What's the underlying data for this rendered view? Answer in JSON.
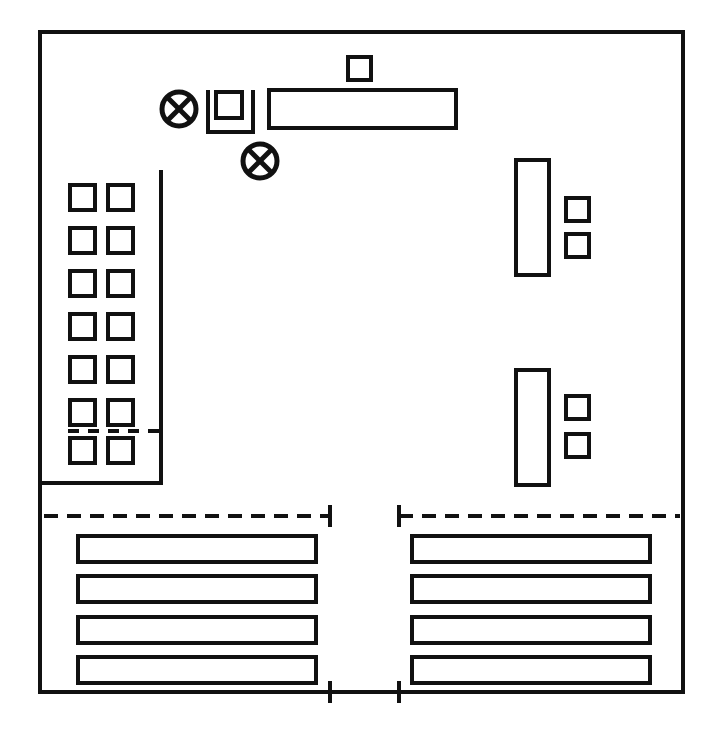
{
  "document": {
    "title": "Technical Schematic Drawing",
    "type": "line-drawing",
    "canvas_width": 718,
    "canvas_height": 734,
    "background_color": "#ffffff",
    "line_color": "#111111"
  },
  "outer_border": {
    "name": "outer-boundary-rectangle",
    "x": 40,
    "y": 32,
    "width": 643,
    "height": 660,
    "stroke_width": 4
  },
  "top_group": {
    "name": "top-fixture-group",
    "crossed_circles": [
      {
        "name": "crossed-circle-1",
        "cx": 179,
        "cy": 109,
        "r": 17,
        "stroke_width": 5
      },
      {
        "name": "crossed-circle-2",
        "cx": 260,
        "cy": 161,
        "r": 17,
        "stroke_width": 5
      }
    ],
    "bracket": {
      "name": "u-bracket-open-top",
      "x": 208,
      "y": 90,
      "width": 45,
      "height": 42,
      "stroke_width": 4
    },
    "bracket_inner_square": {
      "name": "bracket-inner-square",
      "x": 216,
      "y": 92,
      "width": 26,
      "height": 26,
      "stroke_width": 4
    },
    "long_rectangle": {
      "name": "top-long-rectangle",
      "x": 269,
      "y": 90,
      "width": 187,
      "height": 38,
      "stroke_width": 4
    },
    "small_square_above": {
      "name": "top-small-square",
      "x": 348,
      "y": 57,
      "width": 23,
      "height": 23,
      "stroke_width": 4
    }
  },
  "left_grid": {
    "name": "left-square-grid",
    "rows": 7,
    "columns": 2,
    "square_size": 25,
    "col_x": [
      70,
      108
    ],
    "row_y": [
      185,
      228,
      271,
      314,
      357,
      400,
      438
    ],
    "stroke_width": 4,
    "boundary_line": {
      "name": "left-grid-boundary-line",
      "vertical_x": 161,
      "vertical_y_start": 170,
      "vertical_y_end": 483,
      "horizontal_x_start": 40,
      "horizontal_x_end": 161,
      "horizontal_y": 483,
      "stroke_width": 4
    },
    "divider_dashed_line": {
      "name": "left-grid-divider-dashed-line",
      "x_start": 68,
      "x_end": 161,
      "y": 431,
      "stroke_width": 4,
      "dash": "11 9"
    }
  },
  "right_groups": [
    {
      "name": "right-fixture-group-upper",
      "tall_rectangle": {
        "name": "tall-rectangle-upper",
        "x": 516,
        "y": 160,
        "width": 33,
        "height": 115,
        "stroke_width": 4
      },
      "side_squares": [
        {
          "name": "side-square-upper-1",
          "x": 566,
          "y": 198,
          "width": 23,
          "height": 23,
          "stroke_width": 4
        },
        {
          "name": "side-square-upper-2",
          "x": 566,
          "y": 234,
          "width": 23,
          "height": 23,
          "stroke_width": 4
        }
      ]
    },
    {
      "name": "right-fixture-group-lower",
      "tall_rectangle": {
        "name": "tall-rectangle-lower",
        "x": 516,
        "y": 370,
        "width": 33,
        "height": 115,
        "stroke_width": 4
      },
      "side_squares": [
        {
          "name": "side-square-lower-1",
          "x": 566,
          "y": 396,
          "width": 23,
          "height": 23,
          "stroke_width": 4
        },
        {
          "name": "side-square-lower-2",
          "x": 566,
          "y": 434,
          "width": 23,
          "height": 23,
          "stroke_width": 4
        }
      ]
    }
  ],
  "bottom_sections": [
    {
      "name": "bottom-section-left",
      "dashed_dimension_line": {
        "name": "dashed-dimension-line-left",
        "x_start": 44,
        "x_end": 330,
        "y": 516,
        "stroke_width": 4,
        "dash": "14 9",
        "terminator_end": "right",
        "terminator_half_height": 11
      },
      "solid_dimension_line": {
        "name": "solid-dimension-line-left",
        "x_start": 44,
        "x_end": 330,
        "y": 692,
        "stroke_width": 4,
        "terminator_end": "right",
        "terminator_half_height": 11
      },
      "bars": [
        {
          "name": "bar-left-1",
          "x": 78,
          "y": 536,
          "width": 238,
          "height": 26,
          "stroke_width": 4
        },
        {
          "name": "bar-left-2",
          "x": 78,
          "y": 576,
          "width": 238,
          "height": 26,
          "stroke_width": 4
        },
        {
          "name": "bar-left-3",
          "x": 78,
          "y": 617,
          "width": 238,
          "height": 26,
          "stroke_width": 4
        },
        {
          "name": "bar-left-4",
          "x": 78,
          "y": 657,
          "width": 238,
          "height": 26,
          "stroke_width": 4
        }
      ]
    },
    {
      "name": "bottom-section-right",
      "dashed_dimension_line": {
        "name": "dashed-dimension-line-right",
        "x_start": 399,
        "x_end": 680,
        "y": 516,
        "stroke_width": 4,
        "dash": "14 9",
        "terminator_end": "left",
        "terminator_half_height": 11
      },
      "solid_dimension_line": {
        "name": "solid-dimension-line-right",
        "x_start": 399,
        "x_end": 680,
        "y": 692,
        "stroke_width": 4,
        "terminator_end": "left",
        "terminator_half_height": 11
      },
      "bars": [
        {
          "name": "bar-right-1",
          "x": 412,
          "y": 536,
          "width": 238,
          "height": 26,
          "stroke_width": 4
        },
        {
          "name": "bar-right-2",
          "x": 412,
          "y": 576,
          "width": 238,
          "height": 26,
          "stroke_width": 4
        },
        {
          "name": "bar-right-3",
          "x": 412,
          "y": 617,
          "width": 238,
          "height": 26,
          "stroke_width": 4
        },
        {
          "name": "bar-right-4",
          "x": 412,
          "y": 657,
          "width": 238,
          "height": 26,
          "stroke_width": 4
        }
      ]
    }
  ]
}
